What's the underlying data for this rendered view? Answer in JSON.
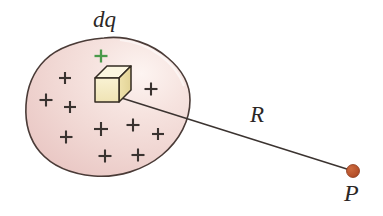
{
  "figure": {
    "kind": "physics-diagram",
    "labels": {
      "charge_element": "dq",
      "distance": "R",
      "field_point": "P"
    },
    "colors": {
      "body_fill_light": "#f7e7e3",
      "body_fill_mid": "#f1d6d3",
      "body_fill_deep": "#e9c5c2",
      "body_outline": "#4a3b37",
      "cube_front": "#f5ecc4",
      "cube_top": "#fbf6e0",
      "cube_side": "#e9dba2",
      "cube_outline": "#332b22",
      "plus_sign": "#3a3330",
      "plus_sign_highlight": "#4a9a4a",
      "point_marker": "#b5502a",
      "point_marker_edge": "#8c3a1c",
      "line": "#3b3330",
      "background": "#ffffff"
    },
    "plus_signs": [
      {
        "x": 46,
        "y": 100,
        "size": 13,
        "color": "plus"
      },
      {
        "x": 65,
        "y": 78,
        "size": 12,
        "color": "plus"
      },
      {
        "x": 70,
        "y": 107,
        "size": 12,
        "color": "plus"
      },
      {
        "x": 101,
        "y": 56,
        "size": 13,
        "color": "highlight"
      },
      {
        "x": 66,
        "y": 137,
        "size": 13,
        "color": "plus"
      },
      {
        "x": 101,
        "y": 129,
        "size": 14,
        "color": "plus"
      },
      {
        "x": 133,
        "y": 125,
        "size": 13,
        "color": "plus"
      },
      {
        "x": 158,
        "y": 134,
        "size": 12,
        "color": "plus"
      },
      {
        "x": 151,
        "y": 89,
        "size": 13,
        "color": "plus"
      },
      {
        "x": 105,
        "y": 156,
        "size": 13,
        "color": "plus"
      },
      {
        "x": 138,
        "y": 155,
        "size": 13,
        "color": "plus"
      }
    ],
    "radius_line": {
      "x1": 112,
      "y1": 95,
      "x2": 350,
      "y2": 170
    },
    "point_marker": {
      "cx": 353,
      "cy": 171,
      "r": 6.5
    },
    "cube": {
      "left": 95,
      "top": 66,
      "width": 36,
      "height": 36,
      "depth": 12
    }
  }
}
